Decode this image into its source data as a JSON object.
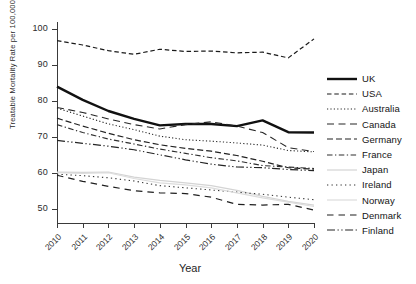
{
  "chart_data": {
    "type": "line",
    "title": "",
    "xlabel": "Year",
    "ylabel": "Treatable Mortality Rate per 100,000",
    "x": [
      2010,
      2011,
      2012,
      2013,
      2014,
      2015,
      2016,
      2017,
      2018,
      2019,
      2020
    ],
    "xtick_labels": [
      "2010",
      "2011",
      "2012",
      "2013",
      "2014",
      "2015",
      "2016",
      "2017",
      "2018",
      "2019",
      "2020"
    ],
    "ytick_labels": [
      "50",
      "60",
      "70",
      "80",
      "90",
      "100"
    ],
    "yticks": [
      50,
      60,
      70,
      80,
      90,
      100
    ],
    "ylim": [
      46,
      102
    ],
    "xlim": [
      2010,
      2020
    ],
    "grid": false,
    "legend_position": "right",
    "series": [
      {
        "name": "UK",
        "style": "solid",
        "width": 2.4,
        "color": "#111111",
        "values": [
          84.0,
          80.3,
          77.2,
          75.0,
          73.2,
          73.6,
          73.6,
          73.0,
          74.6,
          71.3,
          71.2
        ]
      },
      {
        "name": "USA",
        "style": "dashed",
        "width": 1.2,
        "color": "#1a1a1a",
        "values": [
          96.8,
          95.6,
          94.0,
          93.0,
          94.4,
          93.8,
          93.9,
          93.4,
          93.6,
          92.0,
          97.3
        ]
      },
      {
        "name": "Australia",
        "style": "dotted",
        "width": 1.1,
        "color": "#2a2a2a",
        "values": [
          78.0,
          75.8,
          73.6,
          72.0,
          70.2,
          69.2,
          68.8,
          68.3,
          67.7,
          66.2,
          65.8
        ]
      },
      {
        "name": "Canada",
        "style": "dashed-long",
        "width": 1.1,
        "color": "#262626",
        "values": [
          78.2,
          76.8,
          75.0,
          73.4,
          72.2,
          73.4,
          74.2,
          73.0,
          71.2,
          67.0,
          65.9
        ]
      },
      {
        "name": "Germany",
        "style": "dashed-med",
        "width": 1.2,
        "color": "#222222",
        "values": [
          75.2,
          73.0,
          71.0,
          69.2,
          67.8,
          66.8,
          66.0,
          64.8,
          63.2,
          61.4,
          61.0
        ]
      },
      {
        "name": "France",
        "style": "dash-dot",
        "width": 1.1,
        "color": "#2e2e2e",
        "values": [
          73.4,
          71.2,
          69.4,
          68.0,
          66.6,
          65.4,
          64.2,
          63.3,
          62.0,
          61.6,
          61.2
        ]
      },
      {
        "name": "Japan",
        "style": "solid-light",
        "width": 1.2,
        "color": "#d4d4d4",
        "values": [
          60.2,
          60.1,
          60.2,
          58.8,
          57.9,
          57.2,
          56.4,
          55.1,
          53.4,
          52.0,
          51.0
        ]
      },
      {
        "name": "Ireland",
        "style": "dotted-fine",
        "width": 1.1,
        "color": "#303030",
        "values": [
          59.6,
          59.2,
          58.6,
          57.7,
          56.4,
          55.8,
          55.2,
          54.6,
          54.0,
          53.2,
          52.5
        ]
      },
      {
        "name": "Norway",
        "style": "solid-light",
        "width": 1.2,
        "color": "#dcdcdc",
        "values": [
          60.0,
          59.8,
          60.0,
          58.4,
          57.2,
          56.6,
          55.8,
          54.4,
          53.0,
          51.8,
          50.6
        ]
      },
      {
        "name": "Denmark",
        "style": "dashed-wide",
        "width": 1.2,
        "color": "#1f1f1f",
        "values": [
          59.3,
          57.6,
          56.2,
          55.0,
          54.4,
          54.2,
          53.2,
          51.2,
          51.0,
          51.2,
          49.6
        ]
      },
      {
        "name": "Finland",
        "style": "long-dash-dot",
        "width": 1.2,
        "color": "#242424",
        "values": [
          69.0,
          68.2,
          67.4,
          66.4,
          65.0,
          63.6,
          62.4,
          61.6,
          61.4,
          60.9,
          60.6
        ]
      }
    ]
  },
  "legend": {
    "items": [
      {
        "label": "UK"
      },
      {
        "label": "USA"
      },
      {
        "label": "Australia"
      },
      {
        "label": "Canada"
      },
      {
        "label": "Germany"
      },
      {
        "label": "France"
      },
      {
        "label": "Japan"
      },
      {
        "label": "Ireland"
      },
      {
        "label": "Norway"
      },
      {
        "label": "Denmark"
      },
      {
        "label": "Finland"
      }
    ]
  }
}
